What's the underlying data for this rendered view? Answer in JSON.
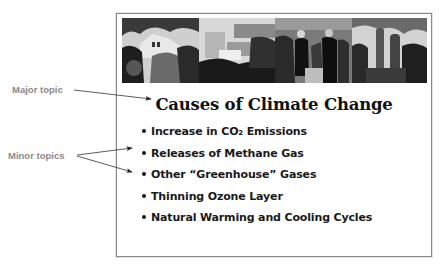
{
  "slide": {
    "banner_image": {
      "description": "grayscale painted montage of houses, buildings and people",
      "panels": [
        "houses-trees",
        "buildings-landscape",
        "people-walking",
        "figures-columns"
      ]
    },
    "title": "Causes of Climate Change",
    "bullets": [
      {
        "text": "Increase in CO₂ Emissions"
      },
      {
        "text": "Releases of Methane Gas"
      },
      {
        "text": "Other “Greenhouse” Gases"
      },
      {
        "text": "Thinning Ozone Layer"
      },
      {
        "text": "Natural Warming and Cooling Cycles"
      }
    ]
  },
  "annotations": {
    "major": {
      "label": "Major topic",
      "points_to": "title"
    },
    "minor": {
      "label": "Minor topics",
      "points_to": [
        "bullet-2",
        "bullet-3"
      ]
    }
  },
  "colors": {
    "annotation_text": "#8a8a8a",
    "frame_border": "#8a8a8a",
    "slide_text": "#111111"
  }
}
